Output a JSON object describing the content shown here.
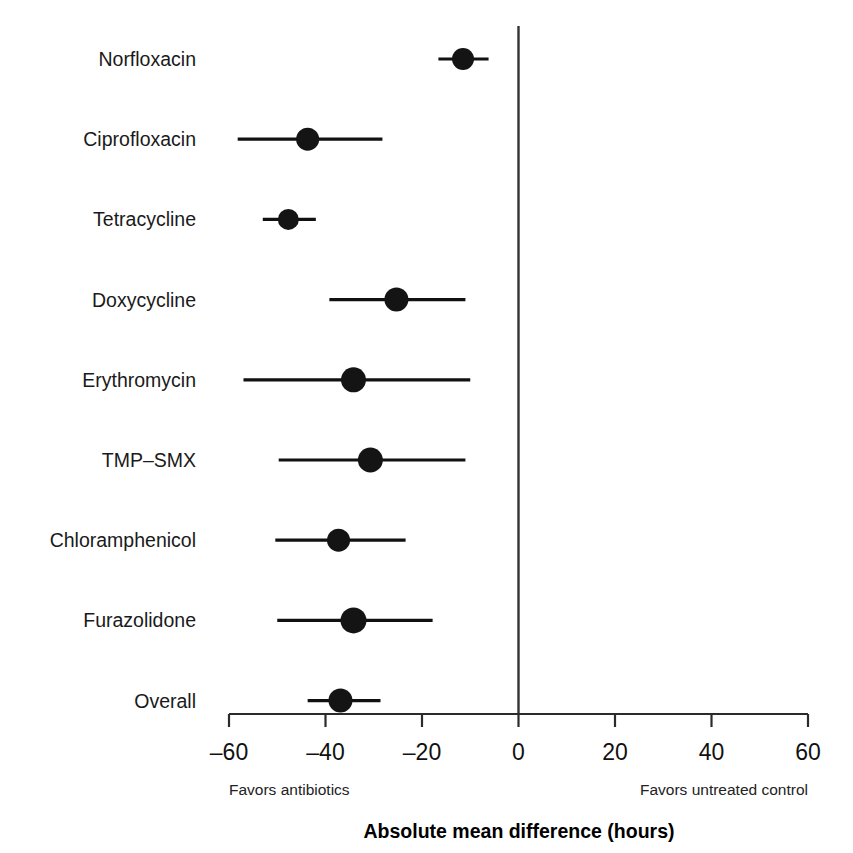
{
  "chart_data": {
    "type": "scatter",
    "subtype": "forest-plot",
    "title": "",
    "xlabel": "Absolute mean difference (hours)",
    "ylabel": "",
    "xlim": [
      -60,
      60
    ],
    "xticks": [
      -60,
      -40,
      -20,
      0,
      20,
      40,
      60
    ],
    "xtick_labels": [
      "–60",
      "–40",
      "–20",
      "0",
      "20",
      "40",
      "60"
    ],
    "grid": false,
    "legend": "none",
    "null_line_value": 0,
    "annotations": {
      "left_note": "Favors antibiotics",
      "right_note": "Favors untreated control"
    },
    "categories": [
      "Norfloxacin",
      "Ciprofloxacin",
      "Tetracycline",
      "Doxycycline",
      "Erythromycin",
      "TMP–SMX",
      "Chloramphenicol",
      "Furazolidone",
      "Overall"
    ],
    "values": [
      -11.5,
      -43.7,
      -47.7,
      -25.3,
      -34.2,
      -30.7,
      -37.3,
      -34.2,
      -36.9
    ],
    "ci_low": [
      -16.6,
      -58.2,
      -53.0,
      -39.2,
      -57.0,
      -49.7,
      -50.4,
      -50.0,
      -43.7
    ],
    "ci_high": [
      -6.2,
      -28.2,
      -42.0,
      -11.0,
      -10.0,
      -11.0,
      -23.4,
      -17.8,
      -28.6
    ],
    "rows": [
      {
        "label": "Norfloxacin",
        "estimate": -11.5,
        "ci_low": -16.6,
        "ci_high": -6.2,
        "marker_size": 11.0,
        "is_summary": false
      },
      {
        "label": "Ciprofloxacin",
        "estimate": -43.7,
        "ci_low": -58.2,
        "ci_high": -28.2,
        "marker_size": 11.5,
        "is_summary": false
      },
      {
        "label": "Tetracycline",
        "estimate": -47.7,
        "ci_low": -53.0,
        "ci_high": -42.0,
        "marker_size": 10.5,
        "is_summary": false
      },
      {
        "label": "Doxycycline",
        "estimate": -25.3,
        "ci_low": -39.2,
        "ci_high": -11.0,
        "marker_size": 12.0,
        "is_summary": false
      },
      {
        "label": "Erythromycin",
        "estimate": -34.2,
        "ci_low": -57.0,
        "ci_high": -10.0,
        "marker_size": 12.5,
        "is_summary": false
      },
      {
        "label": "TMP–SMX",
        "estimate": -30.7,
        "ci_low": -49.7,
        "ci_high": -11.0,
        "marker_size": 12.5,
        "is_summary": false
      },
      {
        "label": "Chloramphenicol",
        "estimate": -37.3,
        "ci_low": -50.4,
        "ci_high": -23.4,
        "marker_size": 11.5,
        "is_summary": false
      },
      {
        "label": "Furazolidone",
        "estimate": -34.2,
        "ci_low": -50.0,
        "ci_high": -17.8,
        "marker_size": 13.0,
        "is_summary": false
      },
      {
        "label": "Overall",
        "estimate": -36.9,
        "ci_low": -43.7,
        "ci_high": -28.6,
        "marker_size": 12.0,
        "is_summary": true
      }
    ],
    "colors": {
      "marker": "#141414",
      "ci_line": "#111111",
      "axis": "#2b2b2b",
      "null_line": "#333333",
      "text": "#111111",
      "background": "#ffffff"
    }
  },
  "figure": {
    "axis_title": "Absolute mean difference (hours)",
    "left_note": "Favors antibiotics",
    "right_note": "Favors untreated control"
  }
}
